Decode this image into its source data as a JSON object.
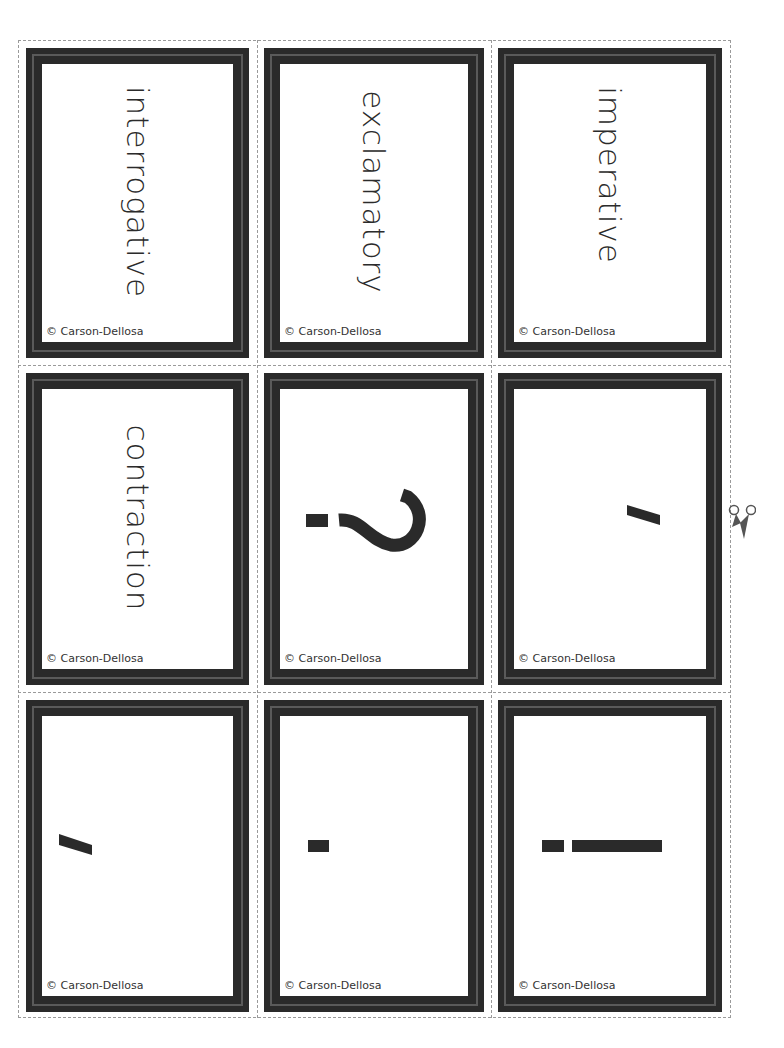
{
  "sheet": {
    "cut_icon": "scissors-icon",
    "copyright": "© Carson-Dellosa",
    "cards": [
      {
        "id": "interrogative",
        "type": "word",
        "text": "interrogative"
      },
      {
        "id": "exclamatory",
        "type": "word",
        "text": "exclamatory"
      },
      {
        "id": "imperative",
        "type": "word",
        "text": "imperative"
      },
      {
        "id": "contraction",
        "type": "word",
        "text": "contraction"
      },
      {
        "id": "question-mark",
        "type": "symbol",
        "text": "?"
      },
      {
        "id": "apostrophe",
        "type": "symbol",
        "text": "'"
      },
      {
        "id": "comma",
        "type": "symbol",
        "text": ","
      },
      {
        "id": "period",
        "type": "symbol",
        "text": "."
      },
      {
        "id": "exclamation-point",
        "type": "symbol",
        "text": "!"
      }
    ]
  },
  "labels": {
    "card1": "interrogative",
    "card2": "exclamatory",
    "card3": "imperative",
    "card4": "contraction",
    "copy": "© Carson-Dellosa"
  },
  "colors": {
    "frame": "#2a2a2a",
    "frame_line": "#5a5a5a",
    "cut_line": "#9a9a9a",
    "text": "#2b2b2b"
  }
}
